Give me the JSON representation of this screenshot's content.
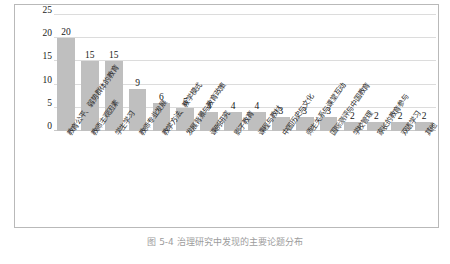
{
  "chart_data": {
    "type": "bar",
    "title": "",
    "xlabel": "",
    "ylabel": "",
    "ylim": [
      0,
      25
    ],
    "yticks": [
      25,
      20,
      15,
      10,
      5,
      0
    ],
    "grid": true,
    "legend": "none",
    "bar_color": "#bfbfbf",
    "categories": [
      "教育公平、弱势群体的教育",
      "教师主观因素",
      "学生学习",
      "教师专业发展",
      "教学方法、教学模式",
      "发展背景与教育政策",
      "课例研究",
      "影子教育",
      "课程与教材",
      "中国历史与文化",
      "师生关系与课堂互动",
      "国际测评与中国教育",
      "学校管理",
      "家长的教育参与",
      "双语学习",
      "其他"
    ],
    "values": [
      20,
      15,
      15,
      9,
      6,
      5,
      4,
      4,
      4,
      3,
      3,
      3,
      2,
      2,
      2,
      2
    ]
  },
  "caption": {
    "text": "图 5-4   治理研究中发现的主要论题分布"
  }
}
